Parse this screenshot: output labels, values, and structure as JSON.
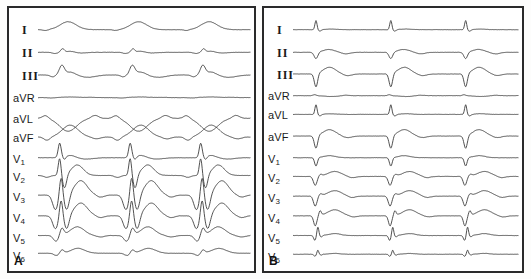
{
  "figure": {
    "type": "ecg-12-lead-comparison",
    "width": 531,
    "height": 279,
    "background_color": "#fdfdfc",
    "trace_color": "#3a3a3a",
    "border_color": "#2a2a2a"
  },
  "panels": [
    {
      "id": "A",
      "letter": "A",
      "beats": 3,
      "leads": [
        {
          "name": "I",
          "label": "I",
          "style": "roman",
          "baseline": 22,
          "amp": 1.0,
          "morph": "wide-monophasic-positive"
        },
        {
          "name": "II",
          "label": "II",
          "style": "roman",
          "baseline": 45,
          "amp": 0.75,
          "morph": "low-notched"
        },
        {
          "name": "III",
          "label": "III",
          "style": "roman",
          "baseline": 68,
          "amp": 1.0,
          "morph": "peaked-positive"
        },
        {
          "name": "aVR",
          "label": "aVR",
          "style": "plain",
          "baseline": 91,
          "amp": 0.35,
          "morph": "flat-undulating"
        },
        {
          "name": "aVL",
          "label": "aVL",
          "style": "plain",
          "baseline": 112,
          "amp": 1.3,
          "morph": "broad-sine-negative"
        },
        {
          "name": "aVF",
          "label": "aVF",
          "style": "plain",
          "baseline": 131,
          "amp": 1.2,
          "morph": "broad-sine-positive"
        },
        {
          "name": "V1",
          "label": "V",
          "sub": "1",
          "style": "plain",
          "baseline": 152,
          "amp": 1.1,
          "morph": "tall-r-spike"
        },
        {
          "name": "V2",
          "label": "V",
          "sub": "2",
          "style": "plain",
          "baseline": 170,
          "amp": 1.25,
          "morph": "rs-deep"
        },
        {
          "name": "V3",
          "label": "V",
          "sub": "3",
          "style": "plain",
          "baseline": 190,
          "amp": 1.35,
          "morph": "qrs-wide-deep"
        },
        {
          "name": "V4",
          "label": "V",
          "sub": "4",
          "style": "plain",
          "baseline": 211,
          "amp": 1.2,
          "morph": "qrs-wide-deep"
        },
        {
          "name": "V5",
          "label": "V",
          "sub": "5",
          "style": "plain",
          "baseline": 231,
          "amp": 0.95,
          "morph": "broad-positive"
        },
        {
          "name": "V6",
          "label": "V",
          "sub": "6",
          "style": "plain",
          "baseline": 249,
          "amp": 0.7,
          "morph": "broad-positive-small"
        }
      ]
    },
    {
      "id": "B",
      "letter": "B",
      "beats": 3,
      "leads": [
        {
          "name": "I",
          "label": "I",
          "style": "roman",
          "baseline": 22,
          "amp": 0.8,
          "morph": "narrow-r-spike"
        },
        {
          "name": "II",
          "label": "II",
          "style": "roman",
          "baseline": 45,
          "amp": 0.85,
          "morph": "qs-negative"
        },
        {
          "name": "III",
          "label": "III",
          "style": "roman",
          "baseline": 67,
          "amp": 1.1,
          "morph": "qs-deep"
        },
        {
          "name": "aVR",
          "label": "aVR",
          "style": "plain",
          "baseline": 89,
          "amp": 0.4,
          "morph": "flat-small-notch"
        },
        {
          "name": "aVL",
          "label": "aVL",
          "style": "plain",
          "baseline": 108,
          "amp": 0.85,
          "morph": "narrow-r-spike"
        },
        {
          "name": "aVF",
          "label": "aVF",
          "style": "plain",
          "baseline": 130,
          "amp": 1.05,
          "morph": "qs-deep"
        },
        {
          "name": "V1",
          "label": "V",
          "sub": "1",
          "style": "plain",
          "baseline": 152,
          "amp": 0.85,
          "morph": "qs-narrow"
        },
        {
          "name": "V2",
          "label": "V",
          "sub": "2",
          "style": "plain",
          "baseline": 171,
          "amp": 0.9,
          "morph": "qs-notched"
        },
        {
          "name": "V3",
          "label": "V",
          "sub": "3",
          "style": "plain",
          "baseline": 191,
          "amp": 1.0,
          "morph": "qs-notched"
        },
        {
          "name": "V4",
          "label": "V",
          "sub": "4",
          "style": "plain",
          "baseline": 211,
          "amp": 0.95,
          "morph": "qs-with-r"
        },
        {
          "name": "V5",
          "label": "V",
          "sub": "5",
          "style": "plain",
          "baseline": 231,
          "amp": 0.8,
          "morph": "qrs-spike"
        },
        {
          "name": "V6",
          "label": "V",
          "sub": "6",
          "style": "plain",
          "baseline": 250,
          "amp": 0.55,
          "morph": "small-qrs-spike"
        }
      ]
    }
  ]
}
